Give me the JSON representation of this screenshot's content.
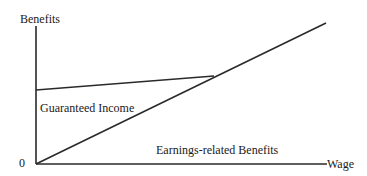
{
  "diagram": {
    "y_axis_label": "Benefits",
    "x_axis_label": "Wage",
    "origin_label": "0",
    "regions": {
      "guaranteed_income": "Guaranteed Income",
      "earnings_related": "Earnings-related Benefits"
    },
    "line_color": "#2a2a2a"
  }
}
